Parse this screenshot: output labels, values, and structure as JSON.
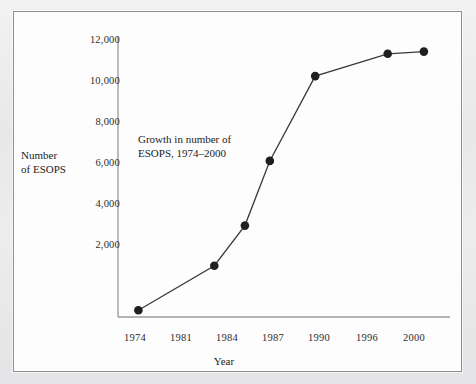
{
  "figure": {
    "background_color": "#fdfdfd",
    "page_color": "#ececed",
    "frame_color": "#8d8f93",
    "axis_color": "#9a9a9a",
    "line_color": "#3a3a3a",
    "marker_color": "#1f1f1f"
  },
  "chart_data": {
    "type": "line",
    "title": "",
    "annotation": "Growth in number of\nESOPS, 1974–2000",
    "xlabel": "Year",
    "ylabel": "Number\nof ESOPS",
    "ylabel_line1": "Number",
    "ylabel_line2": "of ESOPS",
    "grid": false,
    "legend_position": "none",
    "xtick_labels": [
      "1974",
      "1981",
      "1984",
      "1987",
      "1990",
      "1996",
      "2000"
    ],
    "xtick_values": [
      1974,
      1981,
      1984,
      1987,
      1990,
      1996,
      2000
    ],
    "ytick_labels": [
      "2,000",
      "4,000",
      "6,000",
      "8,000",
      "10,000",
      "12,000"
    ],
    "ytick_values": [
      2000,
      4000,
      6000,
      8000,
      10000,
      12000
    ],
    "ylim": [
      0,
      12600
    ],
    "xlim": [
      1972.2,
      2001.5
    ],
    "x": [
      1974,
      1980.7,
      1983.4,
      1985.6,
      1989.6,
      1996,
      1999.2
    ],
    "values": [
      300,
      2300,
      4100,
      7000,
      10800,
      11800,
      11900
    ],
    "series": [
      {
        "name": "Number of ESOPS",
        "points": [
          {
            "x": 1974,
            "y": 300
          },
          {
            "x": 1981,
            "y": 2300
          },
          {
            "x": 1983,
            "y": 4100
          },
          {
            "x": 1986,
            "y": 7000
          },
          {
            "x": 1990,
            "y": 10800
          },
          {
            "x": 1996,
            "y": 11800
          },
          {
            "x": 1999,
            "y": 11900
          }
        ]
      }
    ]
  }
}
